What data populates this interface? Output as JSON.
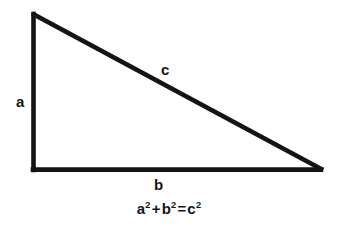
{
  "figure": {
    "background_color": "#ffffff",
    "stroke_color": "#141414",
    "stroke_width": 4.5,
    "width": 338,
    "height": 230
  },
  "triangle": {
    "type": "right-triangle",
    "right_angle_vertex": "bottom-left",
    "vertices": {
      "apex": {
        "x": 33,
        "y": 14
      },
      "bottom_left": {
        "x": 33,
        "y": 170
      },
      "bottom_right": {
        "x": 321,
        "y": 170
      }
    },
    "sides": [
      {
        "name": "vertical-leg",
        "label": "a",
        "from": "apex",
        "to": "bottom_left"
      },
      {
        "name": "horizontal-leg",
        "label": "b",
        "from": "bottom_left",
        "to": "bottom_right"
      },
      {
        "name": "hypotenuse",
        "label": "c",
        "from": "apex",
        "to": "bottom_right"
      }
    ]
  },
  "labels": {
    "leg_a": "a",
    "leg_b": "b",
    "hypotenuse_c": "c"
  },
  "equation": {
    "plain_text": "a² + b² = c²",
    "terms": {
      "a_base": "a",
      "a_exponent": "2",
      "plus": "+",
      "b_base": "b",
      "b_exponent": "2",
      "equals": "=",
      "c_base": "c",
      "c_exponent": "2"
    }
  }
}
